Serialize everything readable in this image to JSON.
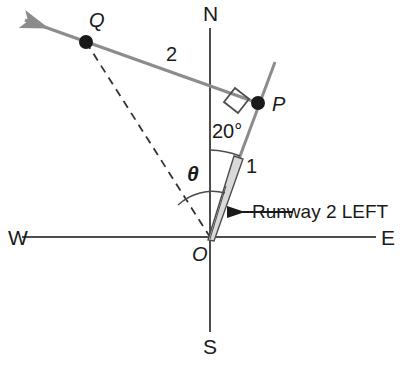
{
  "figure": {
    "type": "geometry-diagram",
    "background_color": "#ffffff"
  },
  "colors": {
    "axis": "#4d4d4d",
    "ray": "#8c8c8c",
    "runway_fill": "#d9d9d9",
    "runway_edge": "#4d4d4d",
    "dashed": "#333333",
    "text": "#1a1a1a",
    "point_dot": "#1a1a1a"
  },
  "compass": {
    "north": "N",
    "south": "S",
    "east": "E",
    "west": "W"
  },
  "points": {
    "origin": "O",
    "p": "P",
    "q": "Q"
  },
  "segments": {
    "op_length": "1",
    "pq_length": "2"
  },
  "angles": {
    "bearing": "20°",
    "theta": "θ"
  },
  "annotations": {
    "runway": "Runway 2 LEFT"
  },
  "geometry": {
    "origin": [
      210,
      237
    ],
    "p": [
      258,
      103
    ],
    "q": [
      86,
      42
    ],
    "arrow_tip": [
      22,
      18
    ],
    "north_axis_top": [
      210,
      28
    ],
    "south_axis_bottom": [
      210,
      332
    ],
    "west_axis_left": [
      22,
      237
    ],
    "east_axis_right": [
      376,
      237
    ],
    "op_extension_top": [
      275,
      62
    ],
    "bearing_degrees": 20
  }
}
